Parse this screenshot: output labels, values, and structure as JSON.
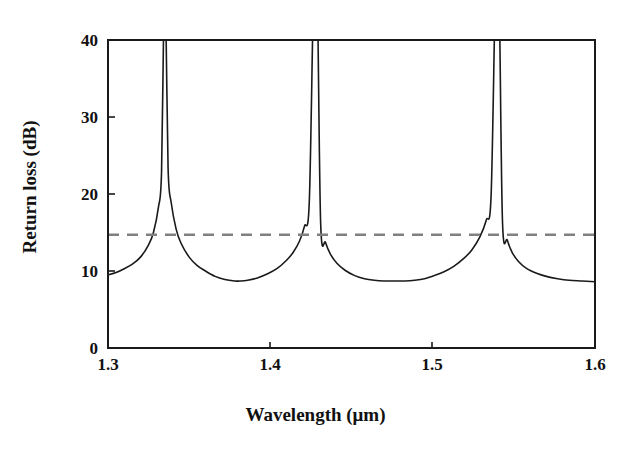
{
  "figure": {
    "background": "#ffffff",
    "frame_color": "#1a1a1a",
    "curve_color": "#1a1a1a",
    "threshold_color": "#808080"
  },
  "axes": {
    "x_title": "Wavelength (μm)",
    "y_title": "Return loss (dB)",
    "x_ticks": [
      "1.3",
      "1.4",
      "1.5",
      "1.6"
    ],
    "y_ticks": [
      "0",
      "10",
      "20",
      "30",
      "40"
    ]
  },
  "chart_data": {
    "type": "line",
    "title": "",
    "xlabel": "Wavelength (μm)",
    "ylabel": "Return loss (dB)",
    "xlim": [
      1.3,
      1.6
    ],
    "ylim": [
      0,
      40
    ],
    "xticks": [
      1.3,
      1.4,
      1.5,
      1.6
    ],
    "yticks": [
      0,
      10,
      20,
      30,
      40
    ],
    "grid": false,
    "legend": "none",
    "series": [
      {
        "name": "Return loss",
        "style": "solid",
        "color": "#1a1a1a",
        "linewidth": 1.6,
        "description": "Periodic resonant return-loss curve clipped at the 40 dB top of the axis; three narrow resonance peaks rising off-scale separated by broad minima near 8.7 dB",
        "resonance_peaks_um": [
          1.335,
          1.428,
          1.54
        ],
        "minima_um": [
          1.381,
          1.483
        ],
        "minimum_value_db": 8.7,
        "value_at_1p3_db": 9.5,
        "value_at_1p6_db": 8.6,
        "x": [
          1.3,
          1.305,
          1.31,
          1.315,
          1.32,
          1.325,
          1.328,
          1.331,
          1.333,
          1.3345,
          1.3355,
          1.337,
          1.339,
          1.342,
          1.345,
          1.35,
          1.355,
          1.36,
          1.366,
          1.372,
          1.378,
          1.381,
          1.386,
          1.392,
          1.398,
          1.404,
          1.41,
          1.414,
          1.418,
          1.421,
          1.424,
          1.4265,
          1.4275,
          1.429,
          1.431,
          1.434,
          1.437,
          1.441,
          1.446,
          1.452,
          1.458,
          1.464,
          1.47,
          1.476,
          1.483,
          1.489,
          1.495,
          1.501,
          1.507,
          1.513,
          1.519,
          1.524,
          1.529,
          1.533,
          1.536,
          1.5385,
          1.5395,
          1.541,
          1.543,
          1.546,
          1.549,
          1.553,
          1.558,
          1.564,
          1.57,
          1.577,
          1.584,
          1.592,
          1.6
        ],
        "y": [
          9.5,
          9.8,
          10.3,
          10.9,
          11.8,
          13.4,
          15.0,
          18.2,
          23.0,
          32.0,
          32.0,
          23.5,
          18.8,
          15.4,
          13.6,
          11.8,
          10.7,
          10.0,
          9.3,
          8.9,
          8.7,
          8.7,
          8.8,
          9.1,
          9.6,
          10.3,
          11.4,
          12.4,
          13.9,
          15.8,
          19.0,
          24.0,
          24.0,
          19.5,
          16.2,
          13.7,
          12.2,
          11.0,
          10.1,
          9.4,
          9.0,
          8.8,
          8.7,
          8.7,
          8.7,
          8.8,
          9.0,
          9.4,
          9.9,
          10.6,
          11.6,
          12.7,
          14.4,
          16.6,
          19.8,
          25.5,
          25.5,
          20.0,
          16.5,
          14.0,
          12.4,
          11.2,
          10.3,
          9.7,
          9.3,
          9.0,
          8.8,
          8.7,
          8.6
        ]
      },
      {
        "name": "Threshold",
        "style": "dashed",
        "color": "#808080",
        "linewidth": 2.4,
        "value_db": 14.7,
        "description": "Horizontal gray dashed reference line drawn across the full width at about 14.7 dB"
      }
    ]
  }
}
